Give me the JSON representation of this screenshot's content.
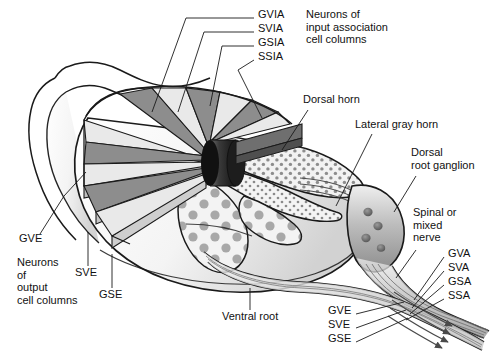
{
  "figure": {
    "background_color": "#ffffff",
    "line_color": "#1a1a1a"
  },
  "palette": {
    "wedge_light": "#e9e9e9",
    "wedge_mid": "#b9b9b9",
    "wedge_dark": "#8d8d8d",
    "wedge_darkest": "#6f6f6f",
    "hub_dark": "#2b2b2b",
    "cord_fill": "#fbfbfb",
    "cord_shade": "#d9d9d9",
    "gray_matter": "#efefef",
    "stipple": "#8f8f8f",
    "nerve_gray": "#c9c9c9",
    "nerve_dark": "#7a7a7a"
  },
  "labels": {
    "input_columns": [
      {
        "id": "gvia",
        "text": "GVIA",
        "x": 258,
        "y": 14
      },
      {
        "id": "svia",
        "text": "SVIA",
        "x": 258,
        "y": 28
      },
      {
        "id": "gsia",
        "text": "GSIA",
        "x": 258,
        "y": 42
      },
      {
        "id": "ssia",
        "text": "SSIA",
        "x": 258,
        "y": 56
      }
    ],
    "input_caption": {
      "id": "neurons-input",
      "text": "Neurons of\ninput association\ncell columns",
      "x": 306,
      "y": 14
    },
    "output_caption": {
      "id": "neurons-output",
      "text": "Neurons\nof\noutput\ncell columns",
      "x": 17,
      "y": 260
    },
    "anatomy": [
      {
        "id": "dorsal-horn",
        "text": "Dorsal horn",
        "x": 303,
        "y": 99
      },
      {
        "id": "lateral-gray-horn",
        "text": "Lateral gray horn",
        "x": 355,
        "y": 124
      },
      {
        "id": "dorsal-root-ganglion",
        "text": "Dorsal\nroot ganglion",
        "x": 411,
        "y": 152
      },
      {
        "id": "spinal-mixed-nerve",
        "text": "Spinal or\nmixed\nnerve",
        "x": 413,
        "y": 212
      },
      {
        "id": "ventral-root",
        "text": "Ventral root",
        "x": 222,
        "y": 316
      }
    ],
    "output_columns": [
      {
        "id": "gve-left",
        "text": "GVE",
        "x": 19,
        "y": 238
      },
      {
        "id": "sve-left",
        "text": "SVE",
        "x": 75,
        "y": 272
      },
      {
        "id": "gse-left",
        "text": "GSE",
        "x": 99,
        "y": 294
      }
    ],
    "afferent_fibers": [
      {
        "id": "gva",
        "text": "GVA",
        "x": 448,
        "y": 253
      },
      {
        "id": "sva",
        "text": "SVA",
        "x": 448,
        "y": 267
      },
      {
        "id": "gsa",
        "text": "GSA",
        "x": 448,
        "y": 281
      },
      {
        "id": "ssa",
        "text": "SSA",
        "x": 448,
        "y": 295
      }
    ],
    "efferent_fibers": [
      {
        "id": "gve-right",
        "text": "GVE",
        "x": 328,
        "y": 310
      },
      {
        "id": "sve-right",
        "text": "SVE",
        "x": 328,
        "y": 324
      },
      {
        "id": "gse-right",
        "text": "GSE",
        "x": 328,
        "y": 338
      }
    ]
  }
}
